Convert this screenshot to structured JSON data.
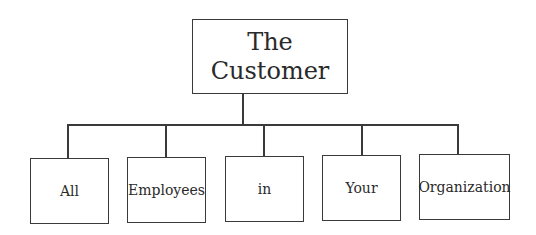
{
  "diagram": {
    "type": "org-chart",
    "root": {
      "line1": "The",
      "line2": "Customer"
    },
    "children": [
      {
        "label": "All"
      },
      {
        "label": "Employees"
      },
      {
        "label": "in"
      },
      {
        "label": "Your"
      },
      {
        "label": "Organization"
      }
    ]
  }
}
